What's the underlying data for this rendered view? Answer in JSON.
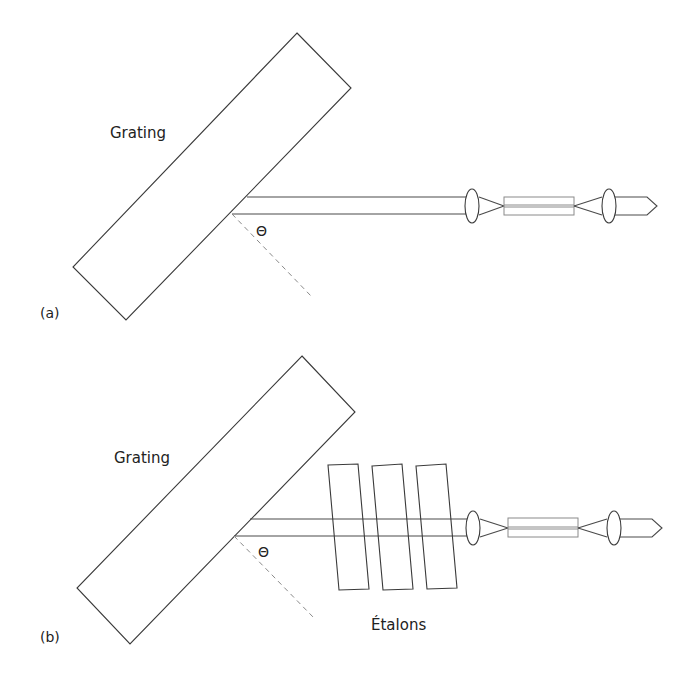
{
  "figure": {
    "panels": [
      {
        "id": "a",
        "panel_label": "(a)",
        "grating_label": "Grating",
        "angle_label": "Θ",
        "components": [
          "grating",
          "beam",
          "lens",
          "gain-fiber",
          "lens",
          "output-arrow"
        ]
      },
      {
        "id": "b",
        "panel_label": "(b)",
        "grating_label": "Grating",
        "angle_label": "Θ",
        "etalon_label": "Étalons",
        "etalon_count": 3,
        "components": [
          "grating",
          "beam",
          "etalon",
          "etalon",
          "etalon",
          "lens",
          "gain-fiber",
          "lens",
          "output-arrow"
        ]
      }
    ]
  },
  "colors": {
    "stroke": "#3a3a3a",
    "fiber": "#8a8a8a",
    "text": "#222222",
    "background": "#ffffff"
  }
}
